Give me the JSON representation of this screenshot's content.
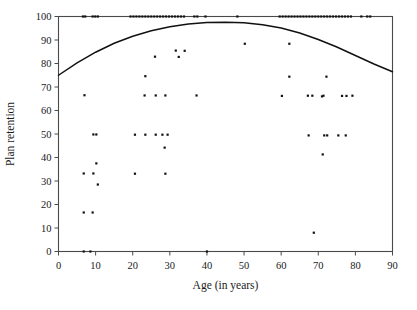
{
  "chart_data": {
    "type": "scatter",
    "title": "",
    "xlabel": "Age (in years)",
    "ylabel": "Plan retention",
    "xlim": [
      0,
      90
    ],
    "ylim": [
      0,
      100
    ],
    "xticks": [
      0,
      10,
      20,
      30,
      40,
      50,
      60,
      70,
      80,
      90
    ],
    "yticks": [
      0,
      10,
      20,
      30,
      40,
      50,
      60,
      70,
      80,
      90,
      100
    ],
    "grid": false,
    "legend": null,
    "marker": "square-dot",
    "marker_color": "#111111",
    "points": [
      [
        6.6,
        100.0
      ],
      [
        7.2,
        100.0
      ],
      [
        9.2,
        100.0
      ],
      [
        9.9,
        100.0
      ],
      [
        10.6,
        100.0
      ],
      [
        19.4,
        100.0
      ],
      [
        20.2,
        100.0
      ],
      [
        21.0,
        100.0
      ],
      [
        21.8,
        100.0
      ],
      [
        22.6,
        100.0
      ],
      [
        23.4,
        100.0
      ],
      [
        24.2,
        100.0
      ],
      [
        25.0,
        100.0
      ],
      [
        25.8,
        100.0
      ],
      [
        26.6,
        100.0
      ],
      [
        27.4,
        100.0
      ],
      [
        28.2,
        100.0
      ],
      [
        29.0,
        100.0
      ],
      [
        29.8,
        100.0
      ],
      [
        30.6,
        100.0
      ],
      [
        31.4,
        100.0
      ],
      [
        32.2,
        100.0
      ],
      [
        33.0,
        100.0
      ],
      [
        33.8,
        100.0
      ],
      [
        36.6,
        100.0
      ],
      [
        37.4,
        100.0
      ],
      [
        39.6,
        100.0
      ],
      [
        48.2,
        100.0
      ],
      [
        59.6,
        100.0
      ],
      [
        60.4,
        100.0
      ],
      [
        61.2,
        100.0
      ],
      [
        62.0,
        100.0
      ],
      [
        62.8,
        100.0
      ],
      [
        63.6,
        100.0
      ],
      [
        64.4,
        100.0
      ],
      [
        65.2,
        100.0
      ],
      [
        66.0,
        100.0
      ],
      [
        66.8,
        100.0
      ],
      [
        67.6,
        100.0
      ],
      [
        68.4,
        100.0
      ],
      [
        69.2,
        100.0
      ],
      [
        70.0,
        100.0
      ],
      [
        70.8,
        100.0
      ],
      [
        71.6,
        100.0
      ],
      [
        72.4,
        100.0
      ],
      [
        73.2,
        100.0
      ],
      [
        74.0,
        100.0
      ],
      [
        74.8,
        100.0
      ],
      [
        75.6,
        100.0
      ],
      [
        76.4,
        100.0
      ],
      [
        77.2,
        100.0
      ],
      [
        78.0,
        100.0
      ],
      [
        78.8,
        100.0
      ],
      [
        81.6,
        100.0
      ],
      [
        83.2,
        100.0
      ],
      [
        84.0,
        100.0
      ],
      [
        50.2,
        88.4
      ],
      [
        62.2,
        88.4
      ],
      [
        31.6,
        85.5
      ],
      [
        34.0,
        85.4
      ],
      [
        32.4,
        82.8
      ],
      [
        26.0,
        82.9
      ],
      [
        23.4,
        74.6
      ],
      [
        62.2,
        74.4
      ],
      [
        72.2,
        74.4
      ],
      [
        7.0,
        66.5
      ],
      [
        23.2,
        66.4
      ],
      [
        26.2,
        66.4
      ],
      [
        28.8,
        66.4
      ],
      [
        37.2,
        66.4
      ],
      [
        60.2,
        66.2
      ],
      [
        67.2,
        66.3
      ],
      [
        68.4,
        66.3
      ],
      [
        71.0,
        66.0
      ],
      [
        71.4,
        66.3
      ],
      [
        76.4,
        66.2
      ],
      [
        77.6,
        66.2
      ],
      [
        79.2,
        66.3
      ],
      [
        9.4,
        49.8
      ],
      [
        10.2,
        49.8
      ],
      [
        20.6,
        49.7
      ],
      [
        23.4,
        49.7
      ],
      [
        26.2,
        49.7
      ],
      [
        28.0,
        49.7
      ],
      [
        29.4,
        49.7
      ],
      [
        67.4,
        49.4
      ],
      [
        71.6,
        49.4
      ],
      [
        72.4,
        49.4
      ],
      [
        75.4,
        49.4
      ],
      [
        77.4,
        49.4
      ],
      [
        28.6,
        44.2
      ],
      [
        71.2,
        41.3
      ],
      [
        10.2,
        37.5
      ],
      [
        6.8,
        33.2
      ],
      [
        9.4,
        33.2
      ],
      [
        20.6,
        33.1
      ],
      [
        28.8,
        33.1
      ],
      [
        10.6,
        28.5
      ],
      [
        6.8,
        16.6
      ],
      [
        9.2,
        16.6
      ],
      [
        68.8,
        8.0
      ],
      [
        6.8,
        0.0
      ],
      [
        8.6,
        0.0
      ],
      [
        40.0,
        0.0
      ]
    ],
    "fit_curve": {
      "description": "quadratic fit line",
      "points": [
        [
          0,
          75.0
        ],
        [
          5,
          80.3
        ],
        [
          10,
          84.8
        ],
        [
          15,
          88.6
        ],
        [
          20,
          91.6
        ],
        [
          25,
          93.9
        ],
        [
          30,
          95.6
        ],
        [
          35,
          96.8
        ],
        [
          40,
          97.4
        ],
        [
          45,
          97.6
        ],
        [
          50,
          97.3
        ],
        [
          55,
          96.5
        ],
        [
          60,
          95.1
        ],
        [
          65,
          93.0
        ],
        [
          70,
          90.2
        ],
        [
          75,
          87.0
        ],
        [
          80,
          83.4
        ],
        [
          85,
          79.8
        ],
        [
          90,
          76.5
        ]
      ]
    }
  },
  "axes": {
    "x": {
      "label": "Age (in years)",
      "tick_labels": [
        "0",
        "10",
        "20",
        "30",
        "40",
        "50",
        "60",
        "70",
        "80",
        "90"
      ]
    },
    "y": {
      "label": "Plan retention",
      "tick_labels": [
        "0",
        "10",
        "20",
        "30",
        "40",
        "50",
        "60",
        "70",
        "80",
        "90",
        "100"
      ]
    }
  },
  "colors": {
    "point": "#111111",
    "curve": "#111111",
    "frame": "#4a4a4a",
    "background": "#ffffff"
  }
}
